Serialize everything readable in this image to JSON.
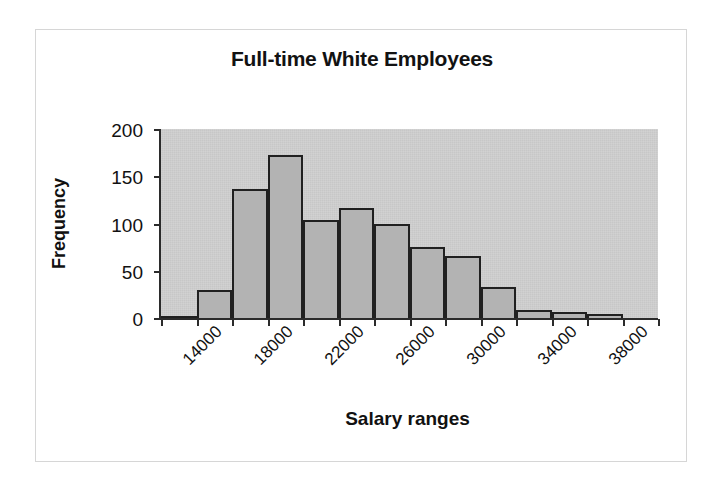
{
  "figure": {
    "background_color": "#ffffff",
    "frame_color": "#d6d6d6",
    "plot_bg_color": "#c7c7c7",
    "bar_fill_color": "#b3b3b3",
    "bar_border_color": "#202020",
    "axis_color": "#2b2b2b"
  },
  "chart_data": {
    "type": "bar",
    "title": "Full-time White Employees",
    "xlabel": "Salary ranges",
    "ylabel": "Frequency",
    "categories": [
      "14000",
      "16000",
      "18000",
      "20000",
      "22000",
      "24000",
      "26000",
      "28000",
      "30000",
      "32000",
      "34000",
      "36000",
      "38000",
      "40000"
    ],
    "tick_labels": [
      "14000",
      "18000",
      "22000",
      "26000",
      "30000",
      "34000",
      "38000"
    ],
    "tick_label_rotation": -45,
    "values": [
      2,
      30,
      137,
      172,
      104,
      116,
      99,
      75,
      66,
      33,
      8,
      6,
      4,
      0
    ],
    "ylim": [
      0,
      200
    ],
    "yticks": [
      0,
      50,
      100,
      150,
      200
    ],
    "ytick_labels": [
      "0",
      "50",
      "100",
      "150",
      "200"
    ],
    "grid": false,
    "legend": null,
    "bar_count": 14,
    "bin_width": 2000
  }
}
